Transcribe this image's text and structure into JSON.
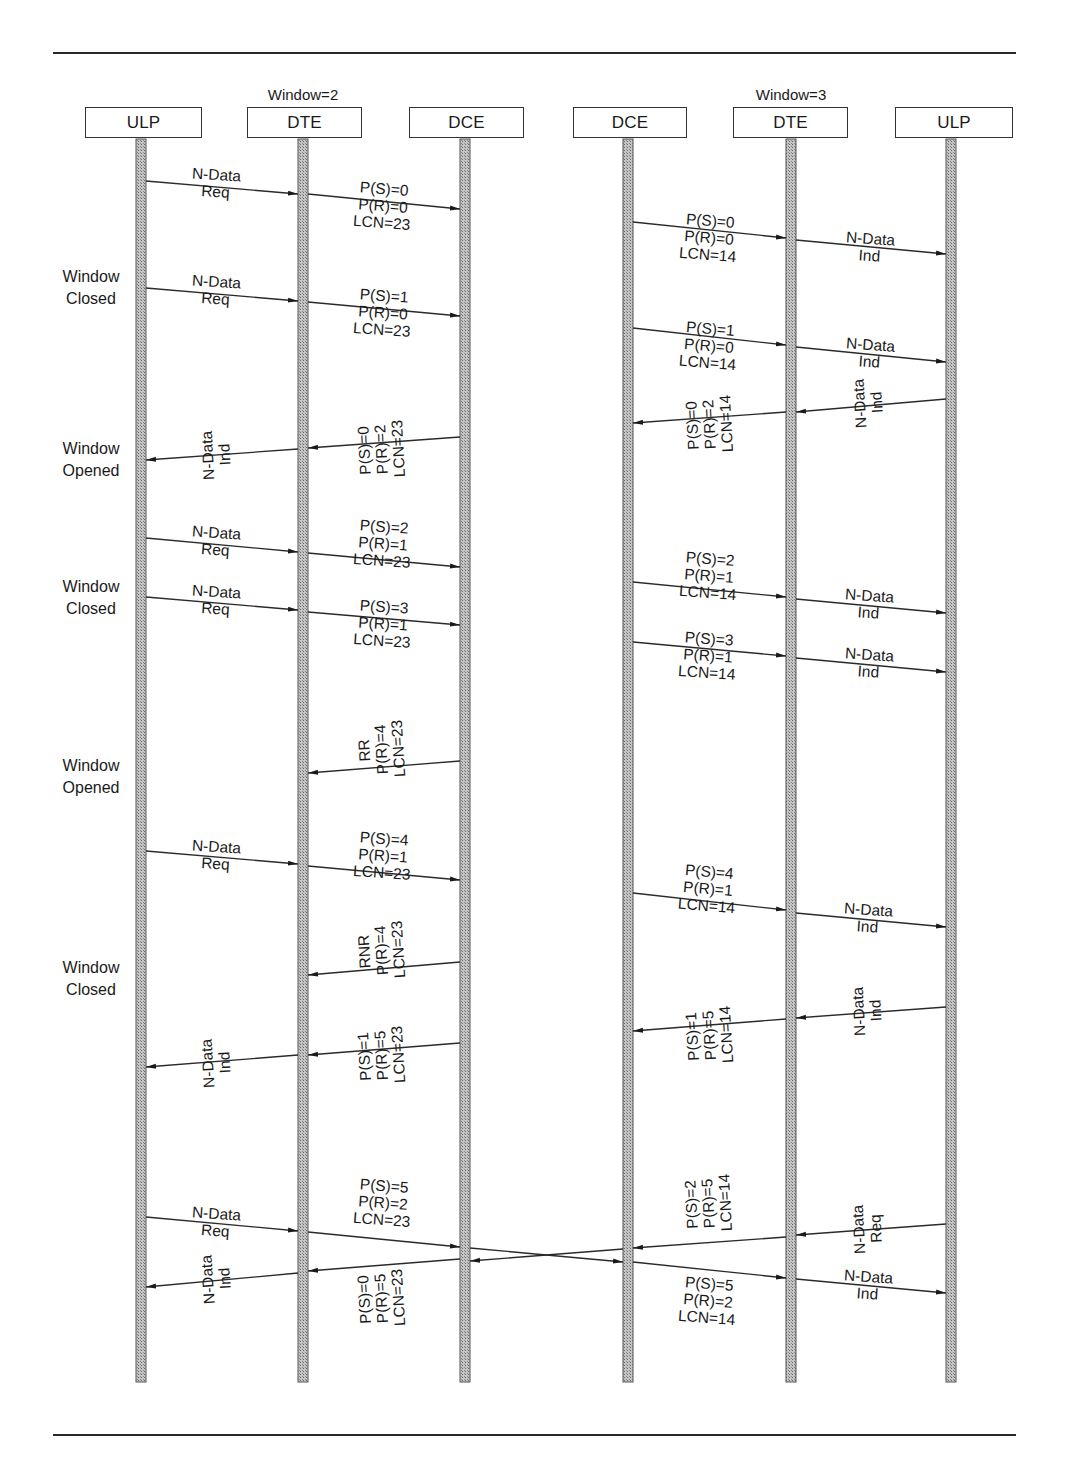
{
  "diagram": {
    "colors": {
      "line": "#2a2a2a",
      "lifeline_fill": "#a9a9a9",
      "lifeline_border": "#555555",
      "background": "#ffffff"
    },
    "participants": [
      {
        "id": "ulp1",
        "label": "ULP",
        "x": 141,
        "box_left": 85,
        "box_width": 117
      },
      {
        "id": "dte1",
        "label": "DTE",
        "x": 303,
        "box_left": 247,
        "box_width": 115,
        "note": "Window=2"
      },
      {
        "id": "dce1",
        "label": "DCE",
        "x": 465,
        "box_left": 409,
        "box_width": 115
      },
      {
        "id": "dce2",
        "label": "DCE",
        "x": 628,
        "box_left": 573,
        "box_width": 114
      },
      {
        "id": "dte2",
        "label": "DTE",
        "x": 791,
        "box_left": 733,
        "box_width": 115,
        "note": "Window=3"
      },
      {
        "id": "ulp2",
        "label": "ULP",
        "x": 951,
        "box_left": 895,
        "box_width": 118
      }
    ],
    "side_labels": [
      {
        "text": "Window\nClosed",
        "y": 266
      },
      {
        "text": "Window\nOpened",
        "y": 438
      },
      {
        "text": "Window\nClosed",
        "y": 576
      },
      {
        "text": "Window\nOpened",
        "y": 755
      },
      {
        "text": "Window\nClosed",
        "y": 957
      }
    ],
    "messages": [
      {
        "from": 0,
        "to": 1,
        "y1": 181,
        "y2": 194,
        "label": "N-Data\nReq",
        "lx": 216,
        "ly": 166
      },
      {
        "from": 1,
        "to": 2,
        "y1": 194,
        "y2": 209,
        "label": "P(S)=0\nP(R)=0\nLCN=23",
        "lx": 383,
        "ly": 180
      },
      {
        "from": 3,
        "to": 4,
        "y1": 222,
        "y2": 238,
        "label": "P(S)=0\nP(R)=0\nLCN=14",
        "lx": 709,
        "ly": 212
      },
      {
        "from": 4,
        "to": 5,
        "y1": 240,
        "y2": 254,
        "label": "N-Data\nInd",
        "lx": 870,
        "ly": 230
      },
      {
        "from": 0,
        "to": 1,
        "y1": 288,
        "y2": 301,
        "label": "N-Data\nReq",
        "lx": 216,
        "ly": 273
      },
      {
        "from": 1,
        "to": 2,
        "y1": 302,
        "y2": 316,
        "label": "P(S)=1\nP(R)=0\nLCN=23",
        "lx": 383,
        "ly": 287
      },
      {
        "from": 3,
        "to": 4,
        "y1": 328,
        "y2": 345,
        "label": "P(S)=1\nP(R)=0\nLCN=14",
        "lx": 709,
        "ly": 320
      },
      {
        "from": 4,
        "to": 5,
        "y1": 347,
        "y2": 362,
        "label": "N-Data\nInd",
        "lx": 870,
        "ly": 336
      },
      {
        "from": 5,
        "to": 4,
        "y1": 399,
        "y2": 412,
        "label": "N-Data\nInd",
        "lx": 868,
        "ly": 386
      },
      {
        "from": 4,
        "to": 3,
        "y1": 412,
        "y2": 423,
        "label": "P(S)=0\nP(R)=2\nLCN=14",
        "lx": 709,
        "ly": 399
      },
      {
        "from": 2,
        "to": 1,
        "y1": 437,
        "y2": 448,
        "label": "P(S)=0\nP(R)=2\nLCN=23",
        "lx": 381,
        "ly": 424
      },
      {
        "from": 1,
        "to": 0,
        "y1": 449,
        "y2": 460,
        "label": "N-Data\nInd",
        "lx": 216,
        "ly": 438
      },
      {
        "from": 0,
        "to": 1,
        "y1": 538,
        "y2": 552,
        "label": "N-Data\nReq",
        "lx": 216,
        "ly": 524
      },
      {
        "from": 1,
        "to": 2,
        "y1": 553,
        "y2": 567,
        "label": "P(S)=2\nP(R)=1\nLCN=23",
        "lx": 383,
        "ly": 518
      },
      {
        "from": 3,
        "to": 4,
        "y1": 582,
        "y2": 597,
        "label": "P(S)=2\nP(R)=1\nLCN=14",
        "lx": 709,
        "ly": 550
      },
      {
        "from": 4,
        "to": 5,
        "y1": 599,
        "y2": 613,
        "label": "N-Data\nInd",
        "lx": 869,
        "ly": 587
      },
      {
        "from": 0,
        "to": 1,
        "y1": 597,
        "y2": 610,
        "label": "N-Data\nReq",
        "lx": 216,
        "ly": 583
      },
      {
        "from": 1,
        "to": 2,
        "y1": 612,
        "y2": 625,
        "label": "P(S)=3\nP(R)=1\nLCN=23",
        "lx": 383,
        "ly": 598
      },
      {
        "from": 3,
        "to": 4,
        "y1": 642,
        "y2": 656,
        "label": "P(S)=3\nP(R)=1\nLCN=14",
        "lx": 708,
        "ly": 630
      },
      {
        "from": 4,
        "to": 5,
        "y1": 658,
        "y2": 672,
        "label": "N-Data\nInd",
        "lx": 869,
        "ly": 646
      },
      {
        "from": 2,
        "to": 1,
        "y1": 761,
        "y2": 773,
        "label": "RR\nP(R)=4\nLCN=23",
        "lx": 381,
        "ly": 724
      },
      {
        "from": 0,
        "to": 1,
        "y1": 851,
        "y2": 864,
        "label": "N-Data\nReq",
        "lx": 216,
        "ly": 838
      },
      {
        "from": 1,
        "to": 2,
        "y1": 866,
        "y2": 880,
        "label": "P(S)=4\nP(R)=1\nLCN=23",
        "lx": 383,
        "ly": 830
      },
      {
        "from": 3,
        "to": 4,
        "y1": 893,
        "y2": 910,
        "label": "P(S)=4\nP(R)=1\nLCN=14",
        "lx": 708,
        "ly": 863
      },
      {
        "from": 4,
        "to": 5,
        "y1": 913,
        "y2": 927,
        "label": "N-Data\nInd",
        "lx": 868,
        "ly": 901
      },
      {
        "from": 2,
        "to": 1,
        "y1": 962,
        "y2": 975,
        "label": "RNR\nP(R)=4\nLCN=23",
        "lx": 381,
        "ly": 925
      },
      {
        "from": 5,
        "to": 4,
        "y1": 1007,
        "y2": 1018,
        "label": "N-Data\nInd",
        "lx": 867,
        "ly": 994
      },
      {
        "from": 4,
        "to": 3,
        "y1": 1019,
        "y2": 1031,
        "label": "P(S)=1\nP(R)=5\nLCN=14",
        "lx": 709,
        "ly": 1010
      },
      {
        "from": 2,
        "to": 1,
        "y1": 1043,
        "y2": 1055,
        "label": "P(S)=1\nP(R)=5\nLCN=23",
        "lx": 381,
        "ly": 1030
      },
      {
        "from": 1,
        "to": 0,
        "y1": 1055,
        "y2": 1067,
        "label": "N-Data\nInd",
        "lx": 216,
        "ly": 1046
      },
      {
        "from": 0,
        "to": 1,
        "y1": 1217,
        "y2": 1231,
        "label": "N-Data\nReq",
        "lx": 216,
        "ly": 1205
      },
      {
        "from": 1,
        "to": 2,
        "y1": 1232,
        "y2": 1247,
        "label": "P(S)=5\nP(R)=2\nLCN=23",
        "lx": 383,
        "ly": 1177
      },
      {
        "from": 2,
        "to": 3,
        "y1": 1248,
        "y2": 1262,
        "label": "",
        "lx": 0,
        "ly": 0
      },
      {
        "from": 3,
        "to": 4,
        "y1": 1262,
        "y2": 1278,
        "label": "P(S)=5\nP(R)=2\nLCN=14",
        "lx": 708,
        "ly": 1275
      },
      {
        "from": 4,
        "to": 5,
        "y1": 1279,
        "y2": 1293,
        "label": "N-Data\nInd",
        "lx": 868,
        "ly": 1268
      },
      {
        "from": 5,
        "to": 4,
        "y1": 1224,
        "y2": 1235,
        "label": "N-Data\nReq",
        "lx": 867,
        "ly": 1212
      },
      {
        "from": 4,
        "to": 3,
        "y1": 1237,
        "y2": 1248,
        "label": "P(S)=2\nP(R)=5\nLCN=14",
        "lx": 708,
        "ly": 1178
      },
      {
        "from": 3,
        "to": 2,
        "y1": 1249,
        "y2": 1261,
        "label": "",
        "lx": 0,
        "ly": 0
      },
      {
        "from": 2,
        "to": 1,
        "y1": 1259,
        "y2": 1271,
        "label": "P(S)=0\nP(R)=5\nLCN=23",
        "lx": 381,
        "ly": 1273
      },
      {
        "from": 1,
        "to": 0,
        "y1": 1273,
        "y2": 1287,
        "label": "N-Data\nInd",
        "lx": 216,
        "ly": 1262
      }
    ]
  }
}
